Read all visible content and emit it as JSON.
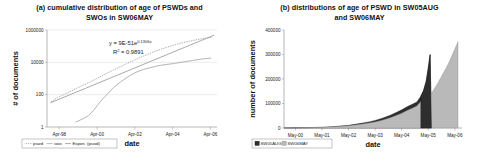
{
  "figure": {
    "panels": [
      "a",
      "b"
    ]
  },
  "chart_data": [
    {
      "type": "line",
      "panel": "a",
      "title": "(a) cumulative distribution of age of PSWDs and SWOs in SW06MAY",
      "title_line1": "(a) cumulative distribution of age of PSWDs and",
      "title_line2": "SWOs in SW06MAY",
      "xlabel": "date",
      "ylabel": "# of documents",
      "yscale": "log",
      "ylim": [
        1,
        1000000
      ],
      "yticks": [
        "1",
        "100",
        "10000",
        "1000000"
      ],
      "ytick_values": [
        1,
        100,
        10000,
        1000000
      ],
      "xticks": [
        "Apr-98",
        "Apr-00",
        "Apr-02",
        "Apr-04",
        "Apr-06"
      ],
      "xtick_values": [
        1998.25,
        2000.25,
        2002.25,
        2004.25,
        2006.25
      ],
      "xlim": [
        1997.6,
        2006.6
      ],
      "grid": true,
      "legend_position": "bottom-left",
      "legend": [
        "pswd",
        "swo",
        "Expon. (pswd)"
      ],
      "annotations": [
        {
          "text": "y = 9E-51e",
          "sup": "0.1306x",
          "x": 0.47,
          "y": 0.13
        },
        {
          "text": "R",
          "sup": "2",
          "text2": " = 0.9891",
          "x": 0.49,
          "y": 0.21
        }
      ],
      "equation_label": "y = 9E-51e",
      "equation_exponent": "0.1306x",
      "r2_label": "R",
      "r2_exponent": "2",
      "r2_value": " = 0.9891",
      "series": [
        {
          "name": "pswd",
          "style": "dotted",
          "x": [
            1997.8,
            1998.1,
            1998.45,
            1998.8,
            1999.2,
            1999.6,
            2000.0,
            2000.4,
            2000.8,
            2001.2,
            2001.6,
            2002.0,
            2002.4,
            2002.8,
            2003.2,
            2003.6,
            2004.0,
            2004.4,
            2004.8,
            2005.2,
            2005.6,
            2006.0,
            2006.35
          ],
          "values": [
            35,
            60,
            95,
            150,
            260,
            430,
            720,
            1250,
            2200,
            3700,
            6200,
            10500,
            17000,
            27000,
            42000,
            62000,
            90000,
            125000,
            165000,
            210000,
            260000,
            310000,
            350000
          ]
        },
        {
          "name": "swo",
          "style": "solid",
          "x": [
            1999.1,
            1999.45,
            1999.8,
            2000.1,
            2000.4,
            2000.75,
            2001.1,
            2001.5,
            2001.9,
            2002.3,
            2002.7,
            2003.1,
            2003.5,
            2003.9,
            2004.3,
            2004.8,
            2005.3,
            2005.8,
            2006.3
          ],
          "values": [
            2,
            3,
            5,
            12,
            35,
            95,
            260,
            620,
            1300,
            2400,
            3600,
            4800,
            6200,
            7300,
            8400,
            10500,
            13000,
            16000,
            18500
          ]
        },
        {
          "name": "Expon. (pswd)",
          "style": "trend",
          "x": [
            1997.8,
            2006.45
          ],
          "values": [
            32,
            480000
          ]
        }
      ]
    },
    {
      "type": "area",
      "panel": "b",
      "title": "(b) distributions of age of PSWD in SW05AUG and SW06MAY",
      "title_line1": "(b) distributions of age of PSWD in SW05AUG",
      "title_line2": "and SW06MAY",
      "xlabel": "date",
      "ylabel": "number of documents",
      "yscale": "linear",
      "ylim": [
        0,
        400000
      ],
      "yticks": [
        "0",
        "100000",
        "200000",
        "300000",
        "400000"
      ],
      "ytick_values": [
        0,
        100000,
        200000,
        300000,
        400000
      ],
      "xticks": [
        "May-00",
        "May-01",
        "May-02",
        "May-03",
        "May-04",
        "May-05",
        "May-06"
      ],
      "xtick_values": [
        2000.33,
        2001.33,
        2002.33,
        2003.33,
        2004.33,
        2005.33,
        2006.33
      ],
      "xlim": [
        1999.9,
        2006.6
      ],
      "grid": false,
      "legend_position": "bottom-left",
      "legend": [
        "SW05AUG",
        "SW06MAY"
      ],
      "series": [
        {
          "name": "SW05AUG",
          "color": "#2e2e2e",
          "x": [
            1999.9,
            2000.33,
            2000.8,
            2001.33,
            2001.8,
            2002.33,
            2002.8,
            2003.1,
            2003.33,
            2003.6,
            2003.9,
            2004.1,
            2004.33,
            2004.55,
            2004.75,
            2004.9,
            2005.05,
            2005.15,
            2005.25,
            2005.33,
            2005.4,
            2005.45
          ],
          "values": [
            200,
            600,
            1500,
            3200,
            6000,
            11000,
            19000,
            25000,
            31000,
            40000,
            52000,
            62000,
            74000,
            88000,
            98000,
            106000,
            130000,
            152000,
            190000,
            245000,
            300000,
            0
          ]
        },
        {
          "name": "SW06MAY",
          "color": "#b9b9b9",
          "x": [
            1999.9,
            2000.33,
            2000.8,
            2001.33,
            2001.8,
            2002.33,
            2002.8,
            2003.1,
            2003.33,
            2003.6,
            2003.9,
            2004.1,
            2004.33,
            2004.55,
            2004.75,
            2004.9,
            2005.05,
            2005.2,
            2005.33,
            2005.5,
            2005.7,
            2005.9,
            2006.1,
            2006.3,
            2006.45
          ],
          "values": [
            150,
            500,
            1200,
            2600,
            4800,
            9000,
            15500,
            20000,
            25000,
            32000,
            42000,
            50000,
            60000,
            72000,
            82000,
            90000,
            108000,
            118000,
            128000,
            150000,
            185000,
            225000,
            265000,
            315000,
            352000
          ]
        }
      ]
    }
  ]
}
